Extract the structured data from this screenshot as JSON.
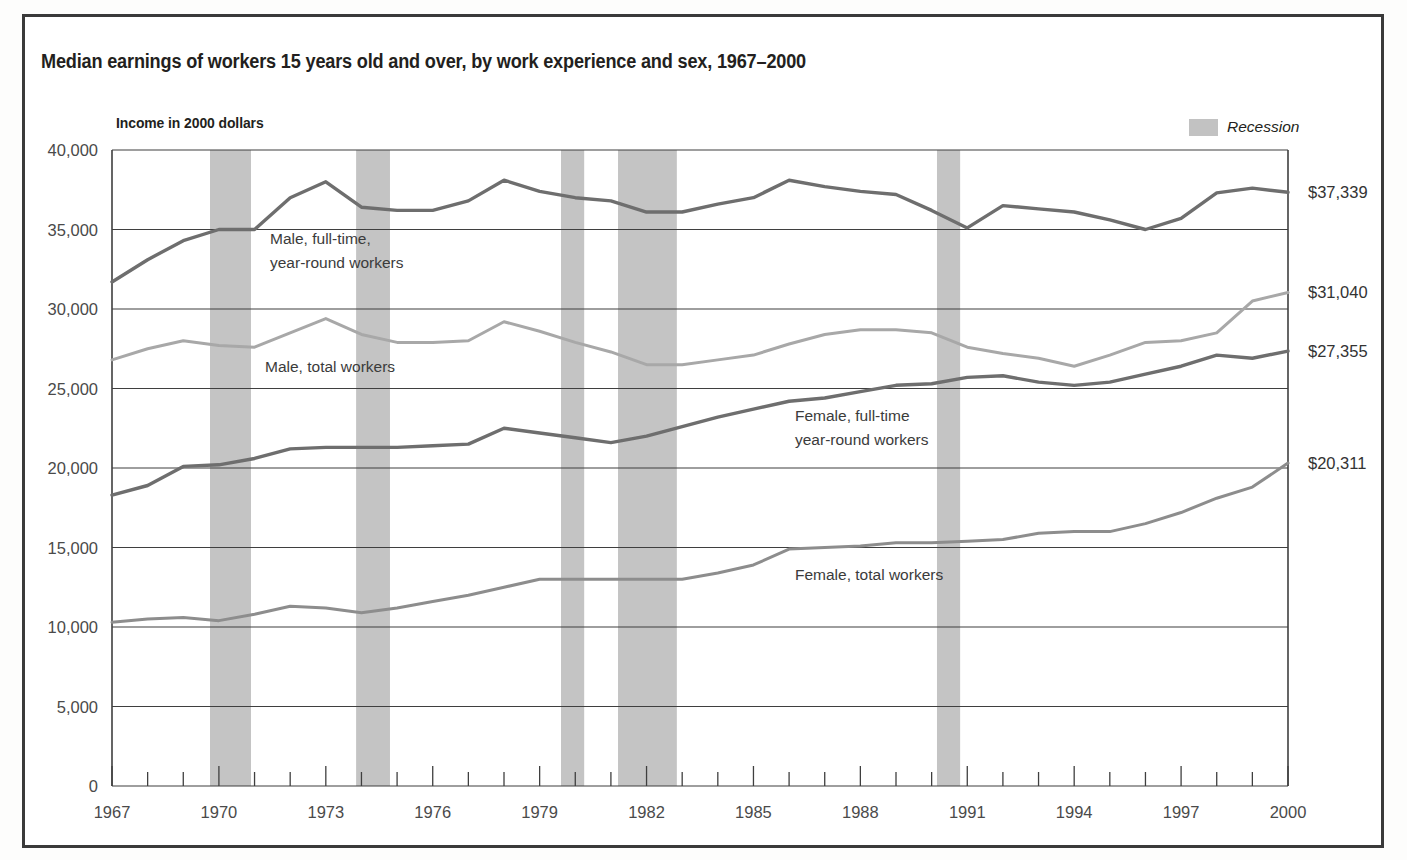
{
  "figure": {
    "title": "Median earnings of workers 15 years old and over, by work experience and sex, 1967–2000",
    "axis_note": "Income in 2000 dollars"
  },
  "legend": {
    "recession_label": "Recession",
    "recession_color": "#c4c4c4"
  },
  "chart_data": {
    "type": "line",
    "title": "Median earnings of workers 15 years old and over, by work experience and sex, 1967–2000",
    "xlabel": "",
    "ylabel": "Income in 2000 dollars",
    "xlim": [
      1967,
      2000
    ],
    "ylim": [
      0,
      40000
    ],
    "grid": true,
    "legend_position": "inline-annotations",
    "ytick_labels": [
      "40,000",
      "35,000",
      "30,000",
      "25,000",
      "20,000",
      "15,000",
      "10,000",
      "5,000",
      "0"
    ],
    "ytick_values": [
      40000,
      35000,
      30000,
      25000,
      20000,
      15000,
      10000,
      5000,
      0
    ],
    "xtick_labels": [
      "1967",
      "1970",
      "1973",
      "1976",
      "1979",
      "1982",
      "1985",
      "1988",
      "1991",
      "1994",
      "1997",
      "2000"
    ],
    "xtick_values": [
      1967,
      1970,
      1973,
      1976,
      1979,
      1982,
      1985,
      1988,
      1991,
      1994,
      1997,
      2000
    ],
    "x": [
      1967,
      1968,
      1969,
      1970,
      1971,
      1972,
      1973,
      1974,
      1975,
      1976,
      1977,
      1978,
      1979,
      1980,
      1981,
      1982,
      1983,
      1984,
      1985,
      1986,
      1987,
      1988,
      1989,
      1990,
      1991,
      1992,
      1993,
      1994,
      1995,
      1996,
      1997,
      1998,
      1999,
      2000
    ],
    "series": [
      {
        "name": "Male, full-time, year-round workers",
        "color": "#6e6e6e",
        "end_value_label": "$37,339",
        "values": [
          31700,
          33100,
          34300,
          35000,
          35000,
          37000,
          38000,
          36400,
          36200,
          36200,
          36800,
          38100,
          37400,
          37000,
          36800,
          36100,
          36100,
          36600,
          37000,
          38100,
          37700,
          37400,
          37200,
          36200,
          35100,
          36500,
          36300,
          36100,
          35600,
          35000,
          35700,
          37300,
          37600,
          37339
        ]
      },
      {
        "name": "Male, total workers",
        "color": "#a8a8a8",
        "end_value_label": "$31,040",
        "values": [
          26800,
          27500,
          28000,
          27700,
          27600,
          28500,
          29400,
          28400,
          27900,
          27900,
          28000,
          29200,
          28600,
          27900,
          27300,
          26500,
          26500,
          26800,
          27100,
          27800,
          28400,
          28700,
          28700,
          28500,
          27600,
          27200,
          26900,
          26400,
          27100,
          27900,
          28000,
          28500,
          30500,
          31040
        ]
      },
      {
        "name": "Female, full-time year-round workers",
        "color": "#6e6e6e",
        "end_value_label": "$27,355",
        "values": [
          18300,
          18900,
          20100,
          20200,
          20600,
          21200,
          21300,
          21300,
          21300,
          21400,
          21500,
          22500,
          22200,
          21900,
          21600,
          22000,
          22600,
          23200,
          23700,
          24200,
          24400,
          24800,
          25200,
          25300,
          25700,
          25800,
          25400,
          25200,
          25400,
          25900,
          26400,
          27100,
          26900,
          27355
        ]
      },
      {
        "name": "Female, total workers",
        "color": "#8d8d8d",
        "end_value_label": "$20,311",
        "values": [
          10300,
          10500,
          10600,
          10400,
          10800,
          11300,
          11200,
          10900,
          11200,
          11600,
          12000,
          12500,
          13000,
          13000,
          13000,
          13000,
          13000,
          13400,
          13900,
          14900,
          15000,
          15100,
          15300,
          15300,
          15400,
          15500,
          15900,
          16000,
          16000,
          16500,
          17200,
          18100,
          18800,
          20311
        ]
      }
    ],
    "annotations": [
      {
        "name": "male-full-time-annotation",
        "lines": [
          "Male, full-time,",
          "year-round workers"
        ],
        "x_px": 270,
        "y_px": 244
      },
      {
        "name": "male-total-annotation",
        "lines": [
          "Male, total workers"
        ],
        "x_px": 265,
        "y_px": 372
      },
      {
        "name": "female-full-time-annotation",
        "lines": [
          "Female, full-time",
          "year-round workers"
        ],
        "x_px": 795,
        "y_px": 421
      },
      {
        "name": "female-total-annotation",
        "lines": [
          "Female, total workers"
        ],
        "x_px": 795,
        "y_px": 580
      }
    ],
    "recessions": [
      {
        "label": "1969-1970",
        "start": 1969.75,
        "end": 1970.9
      },
      {
        "label": "1973-1975",
        "start": 1973.85,
        "end": 1974.8
      },
      {
        "label": "1980",
        "start": 1979.6,
        "end": 1980.25
      },
      {
        "label": "1981-1982",
        "start": 1981.2,
        "end": 1982.85
      },
      {
        "label": "1990-1991",
        "start": 1990.15,
        "end": 1990.8
      }
    ]
  }
}
